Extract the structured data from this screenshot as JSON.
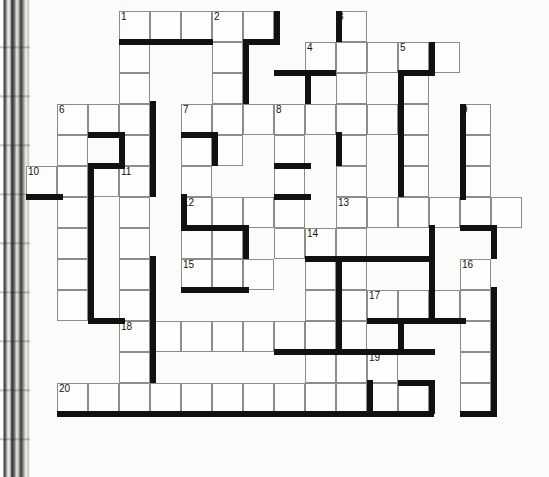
{
  "puzzle": {
    "type": "crossword-grid",
    "title": "Crossword puzzle grid",
    "cell_size": 31,
    "origin": {
      "x": 26,
      "y": 11
    },
    "grid_columns": 16,
    "grid_rows": 13,
    "ink_color": "#111111",
    "cell_fill": "#fdfdfb",
    "cell_stroke": "#8c8c8a",
    "page_background": "#fbfbf9",
    "clue_numbers": [
      1,
      2,
      3,
      4,
      5,
      6,
      7,
      8,
      9,
      10,
      11,
      12,
      13,
      14,
      15,
      16,
      17,
      18,
      19,
      20
    ],
    "entries": [
      {
        "number": 1,
        "direction": "across",
        "row": 0,
        "col": 3,
        "length": 5
      },
      {
        "number": 1,
        "direction": "down",
        "row": 0,
        "col": 3,
        "length": 11
      },
      {
        "number": 2,
        "direction": "down",
        "row": 0,
        "col": 6,
        "length": 4
      },
      {
        "number": 3,
        "direction": "down",
        "row": 0,
        "col": 10,
        "length": 3
      },
      {
        "number": 4,
        "direction": "across",
        "row": 1,
        "col": 9,
        "length": 5
      },
      {
        "number": 5,
        "direction": "down",
        "row": 1,
        "col": 12,
        "length": 4
      },
      {
        "number": 6,
        "direction": "across",
        "row": 3,
        "col": 1,
        "length": 3
      },
      {
        "number": 6,
        "direction": "down",
        "row": 3,
        "col": 1,
        "length": 9
      },
      {
        "number": 7,
        "direction": "across",
        "row": 3,
        "col": 5,
        "length": 3
      },
      {
        "number": 7,
        "direction": "down",
        "row": 3,
        "col": 5,
        "length": 4
      },
      {
        "number": 8,
        "direction": "down",
        "row": 3,
        "col": 8,
        "length": 6
      },
      {
        "number": 9,
        "direction": "down",
        "row": 3,
        "col": 14,
        "length": 4
      },
      {
        "number": 10,
        "direction": "across",
        "row": 5,
        "col": 0,
        "length": 4
      },
      {
        "number": 11,
        "direction": "down",
        "row": 5,
        "col": 3,
        "length": 8
      },
      {
        "number": 12,
        "direction": "across",
        "row": 6,
        "col": 5,
        "length": 4
      },
      {
        "number": 13,
        "direction": "across",
        "row": 6,
        "col": 10,
        "length": 6
      },
      {
        "number": 14,
        "direction": "down",
        "row": 7,
        "col": 9,
        "length": 6
      },
      {
        "number": 15,
        "direction": "across",
        "row": 8,
        "col": 5,
        "length": 3
      },
      {
        "number": 16,
        "direction": "down",
        "row": 8,
        "col": 14,
        "length": 5
      },
      {
        "number": 17,
        "direction": "across",
        "row": 9,
        "col": 11,
        "length": 4
      },
      {
        "number": 18,
        "direction": "across",
        "row": 10,
        "col": 3,
        "length": 6
      },
      {
        "number": 19,
        "direction": "across",
        "row": 11,
        "col": 11,
        "length": 1
      },
      {
        "number": 20,
        "direction": "across",
        "row": 12,
        "col": 1,
        "length": 12
      }
    ],
    "cells": [
      {
        "r": 0,
        "c": 3,
        "n": "1"
      },
      {
        "r": 0,
        "c": 4
      },
      {
        "r": 0,
        "c": 5
      },
      {
        "r": 0,
        "c": 6,
        "n": "2"
      },
      {
        "r": 0,
        "c": 7
      },
      {
        "r": 0,
        "c": 10,
        "n": "3"
      },
      {
        "r": 1,
        "c": 3
      },
      {
        "r": 1,
        "c": 6
      },
      {
        "r": 1,
        "c": 9,
        "n": "4"
      },
      {
        "r": 1,
        "c": 10
      },
      {
        "r": 1,
        "c": 11
      },
      {
        "r": 1,
        "c": 12,
        "n": "5"
      },
      {
        "r": 1,
        "c": 13
      },
      {
        "r": 2,
        "c": 3
      },
      {
        "r": 2,
        "c": 6
      },
      {
        "r": 2,
        "c": 10
      },
      {
        "r": 2,
        "c": 12
      },
      {
        "r": 3,
        "c": 1,
        "n": "6"
      },
      {
        "r": 3,
        "c": 2
      },
      {
        "r": 3,
        "c": 3
      },
      {
        "r": 3,
        "c": 5,
        "n": "7"
      },
      {
        "r": 3,
        "c": 6
      },
      {
        "r": 3,
        "c": 7
      },
      {
        "r": 3,
        "c": 8,
        "n": "8"
      },
      {
        "r": 3,
        "c": 9
      },
      {
        "r": 3,
        "c": 10
      },
      {
        "r": 3,
        "c": 11
      },
      {
        "r": 3,
        "c": 12
      },
      {
        "r": 3,
        "c": 14,
        "n": "9"
      },
      {
        "r": 4,
        "c": 1
      },
      {
        "r": 4,
        "c": 3
      },
      {
        "r": 4,
        "c": 5
      },
      {
        "r": 4,
        "c": 6
      },
      {
        "r": 4,
        "c": 8
      },
      {
        "r": 4,
        "c": 10
      },
      {
        "r": 4,
        "c": 12
      },
      {
        "r": 4,
        "c": 14
      },
      {
        "r": 5,
        "c": 0,
        "n": "10"
      },
      {
        "r": 5,
        "c": 1
      },
      {
        "r": 5,
        "c": 2
      },
      {
        "r": 5,
        "c": 3,
        "n": "11"
      },
      {
        "r": 5,
        "c": 5
      },
      {
        "r": 5,
        "c": 8
      },
      {
        "r": 5,
        "c": 10
      },
      {
        "r": 5,
        "c": 12
      },
      {
        "r": 5,
        "c": 14
      },
      {
        "r": 6,
        "c": 1
      },
      {
        "r": 6,
        "c": 3
      },
      {
        "r": 6,
        "c": 5,
        "n": "12"
      },
      {
        "r": 6,
        "c": 6
      },
      {
        "r": 6,
        "c": 7
      },
      {
        "r": 6,
        "c": 8
      },
      {
        "r": 6,
        "c": 10,
        "n": "13"
      },
      {
        "r": 6,
        "c": 11
      },
      {
        "r": 6,
        "c": 12
      },
      {
        "r": 6,
        "c": 13
      },
      {
        "r": 6,
        "c": 14
      },
      {
        "r": 6,
        "c": 15
      },
      {
        "r": 7,
        "c": 1
      },
      {
        "r": 7,
        "c": 3
      },
      {
        "r": 7,
        "c": 5
      },
      {
        "r": 7,
        "c": 6
      },
      {
        "r": 7,
        "c": 8
      },
      {
        "r": 7,
        "c": 9,
        "n": "14"
      },
      {
        "r": 7,
        "c": 10
      },
      {
        "r": 8,
        "c": 1
      },
      {
        "r": 8,
        "c": 3
      },
      {
        "r": 8,
        "c": 5,
        "n": "15"
      },
      {
        "r": 8,
        "c": 6
      },
      {
        "r": 8,
        "c": 7
      },
      {
        "r": 8,
        "c": 9
      },
      {
        "r": 8,
        "c": 10
      },
      {
        "r": 8,
        "c": 14,
        "n": "16"
      },
      {
        "r": 9,
        "c": 1
      },
      {
        "r": 9,
        "c": 3
      },
      {
        "r": 9,
        "c": 9
      },
      {
        "r": 9,
        "c": 10
      },
      {
        "r": 9,
        "c": 11,
        "n": "17"
      },
      {
        "r": 9,
        "c": 12
      },
      {
        "r": 9,
        "c": 13
      },
      {
        "r": 9,
        "c": 14
      },
      {
        "r": 10,
        "c": 3,
        "n": "18"
      },
      {
        "r": 10,
        "c": 4
      },
      {
        "r": 10,
        "c": 5
      },
      {
        "r": 10,
        "c": 6
      },
      {
        "r": 10,
        "c": 7
      },
      {
        "r": 10,
        "c": 8
      },
      {
        "r": 10,
        "c": 9
      },
      {
        "r": 10,
        "c": 10
      },
      {
        "r": 10,
        "c": 14
      },
      {
        "r": 11,
        "c": 3
      },
      {
        "r": 11,
        "c": 9
      },
      {
        "r": 11,
        "c": 10
      },
      {
        "r": 11,
        "c": 11,
        "n": "19"
      },
      {
        "r": 11,
        "c": 14
      },
      {
        "r": 12,
        "c": 1,
        "n": "20"
      },
      {
        "r": 12,
        "c": 2
      },
      {
        "r": 12,
        "c": 3
      },
      {
        "r": 12,
        "c": 4
      },
      {
        "r": 12,
        "c": 5
      },
      {
        "r": 12,
        "c": 6
      },
      {
        "r": 12,
        "c": 7
      },
      {
        "r": 12,
        "c": 8
      },
      {
        "r": 12,
        "c": 9
      },
      {
        "r": 12,
        "c": 10
      },
      {
        "r": 12,
        "c": 11
      },
      {
        "r": 12,
        "c": 12
      },
      {
        "r": 12,
        "c": 14
      }
    ],
    "shadows": [
      {
        "x": 119,
        "y": 39,
        "w": 94,
        "h": 6
      },
      {
        "x": 274,
        "y": 11,
        "w": 6,
        "h": 31
      },
      {
        "x": 243,
        "y": 39,
        "w": 37,
        "h": 6
      },
      {
        "x": 336,
        "y": 11,
        "w": 6,
        "h": 31
      },
      {
        "x": 243,
        "y": 42,
        "w": 6,
        "h": 62
      },
      {
        "x": 429,
        "y": 42,
        "w": 6,
        "h": 31
      },
      {
        "x": 274,
        "y": 70,
        "w": 62,
        "h": 6
      },
      {
        "x": 398,
        "y": 70,
        "w": 37,
        "h": 6
      },
      {
        "x": 305,
        "y": 70,
        "w": 6,
        "h": 34
      },
      {
        "x": 398,
        "y": 73,
        "w": 6,
        "h": 124
      },
      {
        "x": 150,
        "y": 101,
        "w": 6,
        "h": 96
      },
      {
        "x": 88,
        "y": 132,
        "w": 37,
        "h": 6
      },
      {
        "x": 119,
        "y": 132,
        "w": 6,
        "h": 34
      },
      {
        "x": 181,
        "y": 132,
        "w": 37,
        "h": 6
      },
      {
        "x": 212,
        "y": 132,
        "w": 6,
        "h": 34
      },
      {
        "x": 336,
        "y": 132,
        "w": 6,
        "h": 34
      },
      {
        "x": 460,
        "y": 104,
        "w": 6,
        "h": 96
      },
      {
        "x": 26,
        "y": 194,
        "w": 37,
        "h": 6
      },
      {
        "x": 88,
        "y": 163,
        "w": 37,
        "h": 6
      },
      {
        "x": 274,
        "y": 163,
        "w": 37,
        "h": 6
      },
      {
        "x": 88,
        "y": 166,
        "w": 6,
        "h": 158
      },
      {
        "x": 181,
        "y": 194,
        "w": 6,
        "h": 34
      },
      {
        "x": 274,
        "y": 194,
        "w": 37,
        "h": 6
      },
      {
        "x": 181,
        "y": 225,
        "w": 68,
        "h": 6
      },
      {
        "x": 243,
        "y": 225,
        "w": 6,
        "h": 34
      },
      {
        "x": 429,
        "y": 225,
        "w": 6,
        "h": 34
      },
      {
        "x": 491,
        "y": 225,
        "w": 6,
        "h": 34
      },
      {
        "x": 460,
        "y": 225,
        "w": 37,
        "h": 6
      },
      {
        "x": 336,
        "y": 256,
        "w": 6,
        "h": 96
      },
      {
        "x": 150,
        "y": 256,
        "w": 6,
        "h": 96
      },
      {
        "x": 305,
        "y": 256,
        "w": 130,
        "h": 6
      },
      {
        "x": 429,
        "y": 256,
        "w": 6,
        "h": 65
      },
      {
        "x": 181,
        "y": 287,
        "w": 68,
        "h": 6
      },
      {
        "x": 491,
        "y": 287,
        "w": 6,
        "h": 127
      },
      {
        "x": 367,
        "y": 318,
        "w": 99,
        "h": 6
      },
      {
        "x": 398,
        "y": 318,
        "w": 6,
        "h": 34
      },
      {
        "x": 88,
        "y": 318,
        "w": 37,
        "h": 6
      },
      {
        "x": 274,
        "y": 349,
        "w": 161,
        "h": 6
      },
      {
        "x": 150,
        "y": 349,
        "w": 6,
        "h": 34
      },
      {
        "x": 367,
        "y": 380,
        "w": 6,
        "h": 34
      },
      {
        "x": 398,
        "y": 380,
        "w": 37,
        "h": 6
      },
      {
        "x": 429,
        "y": 380,
        "w": 6,
        "h": 34
      },
      {
        "x": 57,
        "y": 411,
        "w": 377,
        "h": 6
      },
      {
        "x": 460,
        "y": 411,
        "w": 37,
        "h": 6
      }
    ]
  }
}
